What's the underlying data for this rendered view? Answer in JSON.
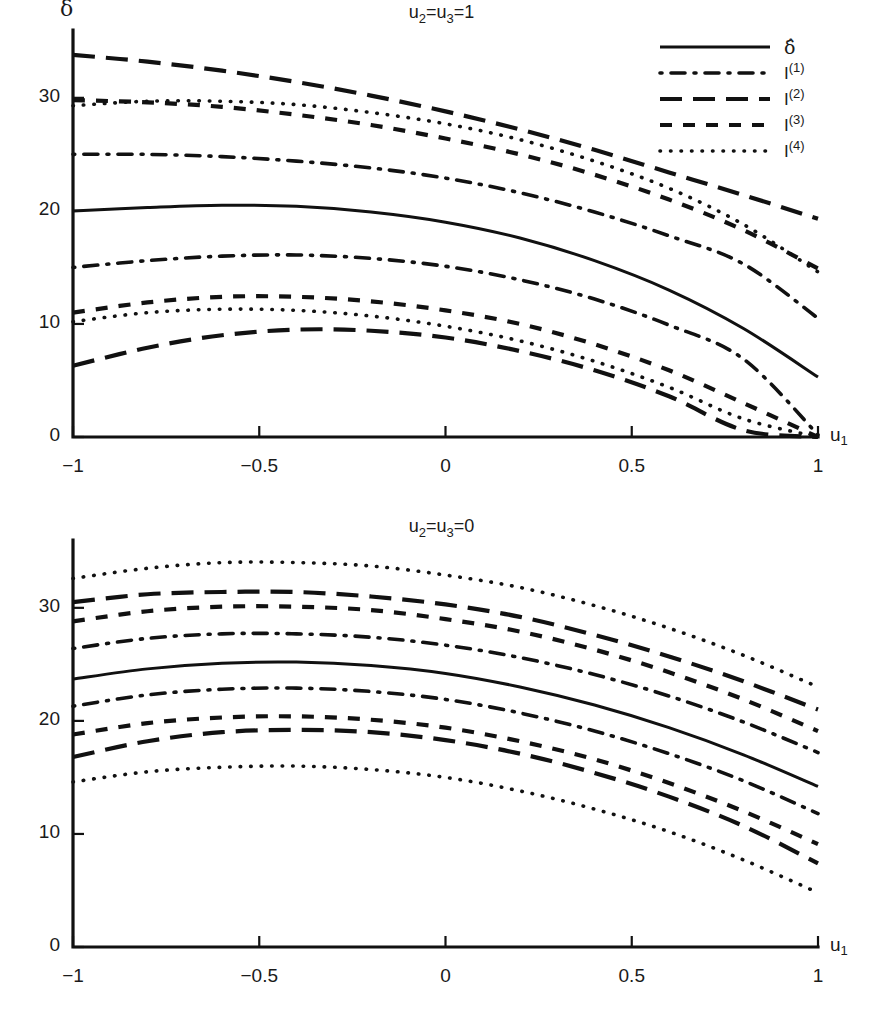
{
  "figure": {
    "background": "#ffffff",
    "ink_color": "#111111",
    "panel_count": 2
  },
  "axis": {
    "x_label_base": "u",
    "x_label_sub": "1",
    "y_label": "δ",
    "x_ticks": [
      "-1",
      "-0.5",
      "0",
      "0.5",
      "1"
    ],
    "x_tick_values": [
      -1,
      -0.5,
      0,
      0.5,
      1
    ],
    "y_ticks": [
      "0",
      "10",
      "20",
      "30"
    ],
    "y_tick_values": [
      0,
      10,
      20,
      30
    ]
  },
  "legend": {
    "position": "top-right of first panel",
    "entries": [
      {
        "style": "solid",
        "label_base": "δ̂",
        "label_sup": "",
        "name": "delta-hat"
      },
      {
        "style": "dashdot",
        "label_base": "I",
        "label_sup": "(1)",
        "name": "I-1"
      },
      {
        "style": "longdash",
        "label_base": "I",
        "label_sup": "(2)",
        "name": "I-2"
      },
      {
        "style": "dash",
        "label_base": "I",
        "label_sup": "(3)",
        "name": "I-3"
      },
      {
        "style": "dot",
        "label_base": "I",
        "label_sup": "(4)",
        "name": "I-4"
      }
    ]
  },
  "panels": [
    {
      "id": "panel-top",
      "title_parts": {
        "u2": "u",
        "sub2": "2",
        "eq1": "=",
        "u3": "u",
        "sub3": "3",
        "eq2": "=",
        "value": "1"
      },
      "title_text": "u2=u3=1"
    },
    {
      "id": "panel-bottom",
      "title_parts": {
        "u2": "u",
        "sub2": "2",
        "eq1": "=",
        "u3": "u",
        "sub3": "3",
        "eq2": "=",
        "value": "0"
      },
      "title_text": "u2=u3=0"
    }
  ],
  "chart_data": [
    {
      "type": "line",
      "panel": "top",
      "title": "u2=u3=1",
      "xlabel": "u1",
      "ylabel": "delta",
      "xlim": [
        -1,
        1
      ],
      "ylim": [
        0,
        36
      ],
      "grid": false,
      "legend_position": "upper right",
      "x": [
        -1,
        -0.8,
        -0.6,
        -0.4,
        -0.2,
        0,
        0.2,
        0.4,
        0.6,
        0.8,
        1
      ],
      "series": [
        {
          "name": "delta-hat",
          "style": "solid",
          "role": "estimate",
          "values": [
            20.0,
            20.3,
            20.5,
            20.4,
            19.9,
            19.0,
            17.6,
            15.6,
            13.0,
            9.6,
            5.3
          ]
        },
        {
          "name": "I(1) upper",
          "style": "dashdot",
          "role": "upper",
          "values": [
            25.0,
            25.0,
            24.8,
            24.4,
            23.8,
            22.9,
            21.6,
            19.9,
            17.8,
            15.3,
            10.5
          ]
        },
        {
          "name": "I(1) lower",
          "style": "dashdot",
          "role": "lower",
          "values": [
            15.0,
            15.6,
            16.0,
            16.1,
            15.8,
            15.1,
            13.9,
            12.2,
            9.9,
            6.9,
            0.2
          ]
        },
        {
          "name": "I(2) upper",
          "style": "longdash",
          "role": "upper",
          "values": [
            33.8,
            33.2,
            32.4,
            31.4,
            30.2,
            28.8,
            27.2,
            25.4,
            23.4,
            21.4,
            19.3
          ]
        },
        {
          "name": "I(2) lower",
          "style": "longdash",
          "role": "lower",
          "values": [
            6.3,
            7.9,
            9.0,
            9.5,
            9.4,
            8.8,
            7.6,
            5.9,
            3.6,
            0.6,
            0.0
          ]
        },
        {
          "name": "I(3) upper",
          "style": "dash",
          "role": "upper",
          "values": [
            29.8,
            29.6,
            29.2,
            28.5,
            27.6,
            26.4,
            25.0,
            23.2,
            21.0,
            18.3,
            14.9
          ]
        },
        {
          "name": "I(3) lower",
          "style": "dash",
          "role": "lower",
          "values": [
            11.0,
            11.9,
            12.4,
            12.4,
            12.0,
            11.2,
            10.0,
            8.2,
            5.9,
            3.0,
            0.0
          ]
        },
        {
          "name": "I(4) upper",
          "style": "dot",
          "role": "upper",
          "values": [
            29.3,
            29.7,
            29.7,
            29.4,
            28.7,
            27.7,
            26.3,
            24.4,
            22.0,
            18.8,
            14.6
          ]
        },
        {
          "name": "I(4) lower",
          "style": "dot",
          "role": "lower",
          "values": [
            10.2,
            11.0,
            11.3,
            11.2,
            10.7,
            9.8,
            8.5,
            6.7,
            4.4,
            1.6,
            0.0
          ]
        }
      ]
    },
    {
      "type": "line",
      "panel": "bottom",
      "title": "u2=u3=0",
      "xlabel": "u1",
      "ylabel": "delta",
      "xlim": [
        -1,
        1
      ],
      "ylim": [
        0,
        36
      ],
      "grid": false,
      "legend_position": "none",
      "x": [
        -1,
        -0.8,
        -0.6,
        -0.4,
        -0.2,
        0,
        0.2,
        0.4,
        0.6,
        0.8,
        1
      ],
      "series": [
        {
          "name": "delta-hat",
          "style": "solid",
          "role": "estimate",
          "values": [
            23.7,
            24.6,
            25.1,
            25.2,
            24.9,
            24.2,
            23.0,
            21.4,
            19.4,
            17.0,
            14.2
          ]
        },
        {
          "name": "I(1) upper",
          "style": "dashdot",
          "role": "upper",
          "values": [
            26.4,
            27.3,
            27.7,
            27.7,
            27.4,
            26.7,
            25.6,
            24.1,
            22.2,
            19.9,
            17.2
          ]
        },
        {
          "name": "I(1) lower",
          "style": "dashdot",
          "role": "lower",
          "values": [
            21.3,
            22.3,
            22.8,
            22.9,
            22.6,
            21.9,
            20.7,
            19.1,
            17.1,
            14.7,
            11.8
          ]
        },
        {
          "name": "I(2) upper",
          "style": "longdash",
          "role": "upper",
          "values": [
            30.5,
            31.2,
            31.4,
            31.4,
            31.0,
            30.3,
            29.2,
            27.6,
            25.7,
            23.5,
            21.0
          ]
        },
        {
          "name": "I(2) lower",
          "style": "longdash",
          "role": "lower",
          "values": [
            16.8,
            18.2,
            19.0,
            19.2,
            19.0,
            18.3,
            17.1,
            15.4,
            13.3,
            10.7,
            7.4
          ]
        },
        {
          "name": "I(3) upper",
          "style": "dash",
          "role": "upper",
          "values": [
            28.8,
            29.7,
            30.1,
            30.1,
            29.8,
            29.0,
            27.9,
            26.3,
            24.3,
            21.9,
            19.1
          ]
        },
        {
          "name": "I(3) lower",
          "style": "dash",
          "role": "lower",
          "values": [
            18.8,
            19.8,
            20.3,
            20.4,
            20.1,
            19.4,
            18.2,
            16.6,
            14.5,
            12.0,
            9.1
          ]
        },
        {
          "name": "I(4) upper",
          "style": "dot",
          "role": "upper",
          "values": [
            32.6,
            33.5,
            34.0,
            34.0,
            33.7,
            32.9,
            31.8,
            30.2,
            28.2,
            25.8,
            23.0
          ]
        },
        {
          "name": "I(4) lower",
          "style": "dot",
          "role": "lower",
          "values": [
            14.6,
            15.5,
            15.9,
            16.0,
            15.7,
            15.0,
            13.8,
            12.2,
            10.2,
            7.7,
            4.8
          ]
        }
      ]
    }
  ]
}
